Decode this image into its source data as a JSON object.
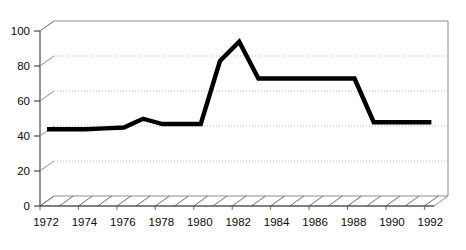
{
  "chart_data": {
    "type": "line",
    "title": "",
    "subtitle": "",
    "xlabel": "",
    "ylabel": "",
    "xlim": [
      1972,
      1992.5
    ],
    "ylim": [
      0,
      100
    ],
    "grid": true,
    "legend": false,
    "legend_position": "none",
    "style": "3d-perspective",
    "line_color": "#000000",
    "gridline_color": "#b9b9b9",
    "axis_color": "#3a3a3a",
    "wall_color": "#8d8d8d",
    "background_color": "#ffffff",
    "y_ticks": [
      0,
      20,
      40,
      60,
      80,
      100
    ],
    "y_tick_labels": [
      "0",
      "20",
      "40",
      "60",
      "80",
      "100"
    ],
    "x_ticks": [
      1972,
      1974,
      1976,
      1978,
      1980,
      1982,
      1984,
      1986,
      1988,
      1990,
      1992
    ],
    "x_tick_labels": [
      "1972",
      "1974",
      "1976",
      "1978",
      "1980",
      "1982",
      "1984",
      "1986",
      "1988",
      "1990",
      "1992"
    ],
    "x": [
      1972,
      1973,
      1974,
      1975,
      1976,
      1977,
      1978,
      1979,
      1980,
      1981,
      1982,
      1983,
      1984,
      1985,
      1986,
      1987,
      1988,
      1989,
      1990,
      1991,
      1992
    ],
    "series": [
      {
        "name": "series-1",
        "values": [
          41,
          41,
          41,
          41.5,
          42,
          47,
          44,
          44,
          44,
          80,
          91,
          70,
          70,
          70,
          70,
          70,
          70,
          45,
          45,
          45,
          45
        ]
      }
    ],
    "annotations": []
  },
  "axis": {
    "y_labels": [
      "100",
      "80",
      "60",
      "40",
      "20",
      "0"
    ],
    "x_labels": [
      "1972",
      "1974",
      "1976",
      "1978",
      "1980",
      "1982",
      "1984",
      "1986",
      "1988",
      "1990",
      "1992"
    ]
  }
}
